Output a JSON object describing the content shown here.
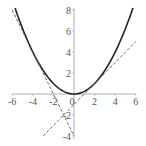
{
  "chart_data": {
    "type": "line",
    "title": "",
    "xlabel": "",
    "ylabel": "",
    "xlim": [
      -6,
      6
    ],
    "ylim": [
      -4.3,
      8.2
    ],
    "grid": false,
    "legend": null,
    "x_ticks": [
      -6,
      -4,
      -2,
      0,
      2,
      4,
      6
    ],
    "x_tick_labels": [
      "-6",
      "-4",
      "-2",
      "0",
      "2",
      "4",
      "6"
    ],
    "y_ticks": [
      -4,
      -2,
      2,
      4,
      6,
      8
    ],
    "y_tick_labels": [
      "-4",
      "-2",
      "2",
      "4",
      "6",
      "8"
    ],
    "series": [
      {
        "name": "parabola y = x^2/4",
        "style": "solid",
        "color": "#222222",
        "function": "x^2/4",
        "x_range": [
          -5.72,
          5.72
        ]
      },
      {
        "name": "tangent at x = -4: y = -2x - 4",
        "style": "dashed",
        "color": "#555555",
        "points": [
          [
            -6,
            8
          ],
          [
            0,
            -4
          ]
        ]
      },
      {
        "name": "tangent at x = 2: y = x - 1",
        "style": "dashed",
        "color": "#555555",
        "points": [
          [
            -3,
            -4
          ],
          [
            6,
            5
          ]
        ]
      }
    ]
  },
  "layout": {
    "origin_px": [
      74,
      94
    ],
    "x_scale": 10.3,
    "y_scale": 10.5,
    "axis_color": "#999999"
  }
}
